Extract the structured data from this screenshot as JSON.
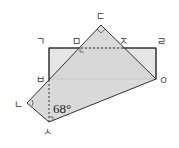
{
  "figure": {
    "colors": {
      "rect_fill": "#e6e6e6",
      "quad_fill": "#d6d6d6",
      "stroke": "#333333"
    },
    "labels": {
      "g": "ㄱ",
      "n": "ㄴ",
      "d": "ㄷ",
      "r": "ㄹ",
      "m": "ㅁ",
      "b": "ㅂ",
      "s": "ㅅ",
      "o": "ㅇ",
      "j": "ㅈ"
    },
    "angle_label": "68°"
  }
}
